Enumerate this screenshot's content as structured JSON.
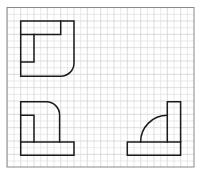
{
  "diagram": {
    "grid": {
      "cell_px": 6.667,
      "origin": [
        20.7,
        21.0
      ],
      "unit_px": 13.333,
      "color": "#d8d8d8"
    },
    "frame": {
      "x": 7,
      "y": 7.5,
      "width": 187,
      "height": 159.5,
      "color": "#8a8a8a"
    },
    "stroke_color": "#1a1a1a",
    "views": [
      {
        "id": "top-view",
        "label": "",
        "paths": [
          "M20.7 21 H74 V63 A13.3 13.3 0 0 1 60.7 76.3 H20.7 Z",
          "M20.7 34.6 H60.7 V21",
          "M34 34.6 V62 H20.7"
        ]
      },
      {
        "id": "front-view",
        "label": "",
        "paths": [
          "M20.7 142 V101.7 H46.3 A13.3 13.3 0 0 1 59.6 115 V142",
          "M20.7 115.3 H34 V142",
          "M20.7 142 H74 V155.3 H20.7 Z"
        ]
      },
      {
        "id": "side-view",
        "label": "",
        "paths": [
          "M127.3 142 H180.6 V155.3 H127.3 Z",
          "M167.3 142 V101.7 H180.6 V142",
          "M140.6 142 A26.7 26.7 0 0 1 167.3 115.3"
        ]
      }
    ]
  }
}
